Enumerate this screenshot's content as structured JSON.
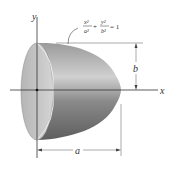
{
  "diagram": {
    "axes": {
      "x_label": "x",
      "y_label": "y"
    },
    "equation": {
      "x_num": "x²",
      "x_den": "a²",
      "plus": "+",
      "y_num": "y²",
      "y_den": "b²",
      "rhs": "= 1",
      "text": "x²/a² + y²/b² = 1"
    },
    "dimensions": {
      "height_label": "b",
      "length_label": "a"
    },
    "colors": {
      "solid_dark": "#6e6e6e",
      "solid_light": "#c8c8c8",
      "face": "#bdbdbd",
      "axis": "#333333"
    }
  }
}
